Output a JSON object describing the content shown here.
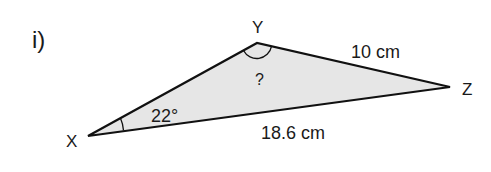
{
  "question": {
    "label": "i)"
  },
  "triangle": {
    "fill_color": "#e6e6e6",
    "stroke_color": "#111111",
    "vertices": {
      "X": {
        "label": "X",
        "x": 88,
        "y": 136
      },
      "Y": {
        "label": "Y",
        "x": 257,
        "y": 43
      },
      "Z": {
        "label": "Z",
        "x": 450,
        "y": 87
      }
    },
    "sides": {
      "YZ": {
        "label": "10 cm"
      },
      "XZ": {
        "label": "18.6 cm"
      }
    },
    "angles": {
      "X": {
        "label": "22°"
      },
      "Y": {
        "label": "?"
      }
    }
  }
}
